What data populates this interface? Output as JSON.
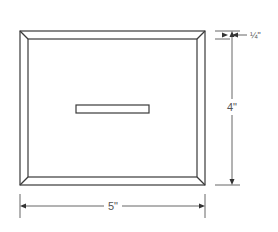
{
  "diagram": {
    "type": "technical-drawing",
    "dimensions": {
      "width_label": "5\"",
      "height_label": "4\"",
      "border_label": "¼\""
    },
    "colors": {
      "line": "#3a3a3a",
      "dimension_line": "#555555",
      "background": "#ffffff"
    }
  }
}
